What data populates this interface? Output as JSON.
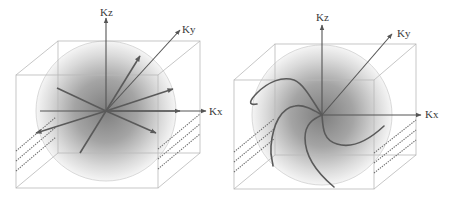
{
  "figure": {
    "panels": [
      {
        "name": "left-panel",
        "description": "Spherical k-space with straight radial trajectories",
        "axes": {
          "z": "Kz",
          "y": "Ky",
          "x": "Kx"
        },
        "trajectory_type": "radial-straight-lines"
      },
      {
        "name": "right-panel",
        "description": "Spherical k-space with curved spiral-like trajectories",
        "axes": {
          "z": "Kz",
          "y": "Ky",
          "x": "Kx"
        },
        "trajectory_type": "curved-spiral-arms"
      }
    ],
    "colors": {
      "background": "#ffffff",
      "cube_edges": "#b8b8b8",
      "axes": "#555555",
      "trajectories": "#5a5a5a",
      "sphere_center": "#8a8a8a",
      "sphere_edge": "#f4f4f4",
      "hatch_lines": "#707070"
    }
  }
}
